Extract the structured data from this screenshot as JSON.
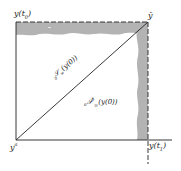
{
  "diagram": {
    "type": "phase-region-diagram",
    "colors": {
      "line": "#222222",
      "band": "#b3b3b3",
      "background": "#ffffff"
    },
    "labels": {
      "top_left": {
        "base": "y(t",
        "sub": "0",
        "close": ")"
      },
      "top_right": {
        "text": "ȳ"
      },
      "bottom_left": {
        "base": "y",
        "sup": "a"
      },
      "bottom_right": {
        "base": "y(t",
        "sub": "1",
        "close": ")"
      },
      "diagonal": {
        "pre_sub": "0",
        "script": "𝒮",
        "sub": "∞",
        "arg": "(y(0))"
      },
      "interior": {
        "pre_sub": "0",
        "script": "𝒮",
        "sup": "*",
        "sub": "∞",
        "arg": "(y(0))"
      }
    },
    "regions": [
      {
        "name": "top-shaded-band",
        "description": "shaded band along top edge"
      },
      {
        "name": "right-shaded-band",
        "description": "shaded band along right edge"
      }
    ],
    "edges": {
      "top": "dashed",
      "right": "dashed",
      "left": "solid",
      "bottom": "solid"
    }
  }
}
